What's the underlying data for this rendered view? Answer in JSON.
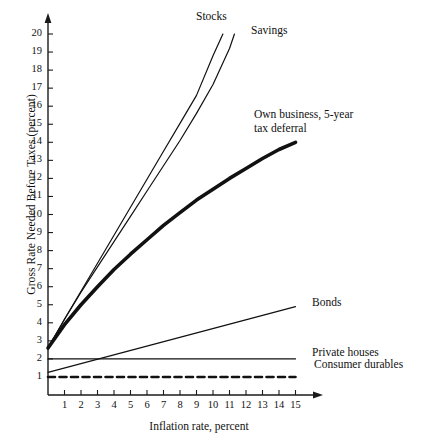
{
  "chart_data": {
    "type": "line",
    "title": "",
    "xlabel": "Inflation rate, percent",
    "ylabel": "Gross Rate Needed Before Taxes (percent)",
    "xlim": [
      0,
      15.8
    ],
    "ylim": [
      0,
      20.6
    ],
    "grid": false,
    "legend_position": "inline-right-annotations",
    "xticks": [
      "1",
      "2",
      "3",
      "4",
      "5",
      "6",
      "7",
      "8",
      "9",
      "10",
      "11",
      "12",
      "13",
      "14",
      "15"
    ],
    "xtick_values": [
      1,
      2,
      3,
      4,
      5,
      6,
      7,
      8,
      9,
      10,
      11,
      12,
      13,
      14,
      15
    ],
    "yticks": [
      "1",
      "2",
      "3",
      "4",
      "5",
      "6",
      "7",
      "8",
      "9",
      "10",
      "11",
      "12",
      "13",
      "14",
      "15",
      "16",
      "17",
      "18",
      "19",
      "20"
    ],
    "ytick_values": [
      1,
      2,
      3,
      4,
      5,
      6,
      7,
      8,
      9,
      10,
      11,
      12,
      13,
      14,
      15,
      16,
      17,
      18,
      19,
      20
    ],
    "series": [
      {
        "name": "Stocks",
        "style": "thin-solid",
        "x": [
          0,
          1,
          2,
          3,
          4,
          5,
          6,
          7,
          8,
          9,
          10,
          10.6
        ],
        "values": [
          2.6,
          4.2,
          5.75,
          7.3,
          8.85,
          10.4,
          11.95,
          13.5,
          15.05,
          16.6,
          18.8,
          20.0
        ]
      },
      {
        "name": "Savings",
        "style": "thin-solid",
        "x": [
          0,
          1,
          2,
          3,
          4,
          5,
          6,
          7,
          8,
          9,
          10,
          11,
          11.3
        ],
        "values": [
          2.6,
          4.2,
          5.7,
          7.1,
          8.5,
          9.9,
          11.3,
          12.7,
          14.1,
          15.6,
          17.2,
          19.2,
          20.0
        ]
      },
      {
        "name": "Own business, 5-year\ntax deferral",
        "label_line1": "Own business, 5-year",
        "label_line2": "tax deferral",
        "style": "thick-solid",
        "x": [
          0,
          1,
          2,
          3,
          4,
          5,
          6,
          7,
          8,
          9,
          10,
          11,
          12,
          13,
          14,
          15
        ],
        "values": [
          2.6,
          3.9,
          5.0,
          6.0,
          6.95,
          7.8,
          8.6,
          9.4,
          10.1,
          10.8,
          11.4,
          12.0,
          12.55,
          13.1,
          13.6,
          14.0
        ]
      },
      {
        "name": "Bonds",
        "style": "thin-solid",
        "x": [
          0,
          15
        ],
        "values": [
          1.25,
          4.9
        ]
      },
      {
        "name": "Private houses",
        "style": "thin-solid",
        "x": [
          0,
          15
        ],
        "values": [
          2.0,
          2.0
        ]
      },
      {
        "name": "Consumer durables",
        "style": "dashed",
        "x": [
          0,
          15
        ],
        "values": [
          1.0,
          1.0
        ]
      }
    ],
    "annotations": [
      {
        "text": "Stocks",
        "x": 9.0,
        "y": 20.4
      },
      {
        "text": "Savings",
        "x": 12.0,
        "y": 19.6
      },
      {
        "text": "Own business, 5-year",
        "x": 12.4,
        "y": 16.3
      },
      {
        "text": "tax deferral",
        "x": 12.4,
        "y": 15.1
      },
      {
        "text": "Bonds",
        "x": 15.5,
        "y": 5.1
      },
      {
        "text": "Private houses",
        "x": 15.5,
        "y": 2.1
      },
      {
        "text": "Consumer durables",
        "x": 15.7,
        "y": 1.1
      }
    ],
    "colors": {
      "axis": "#1a1a1a",
      "line": "#111111",
      "background": "#ffffff"
    }
  }
}
